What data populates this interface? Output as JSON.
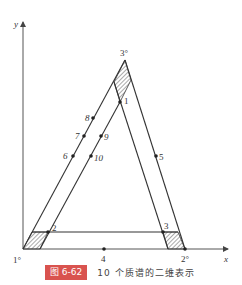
{
  "figure": {
    "badge": "图 6-62",
    "caption": "10 个质谱的二维表示",
    "accent_color": "#d9534f"
  },
  "axes": {
    "x_label": "x",
    "y_label": "y"
  },
  "vertices": {
    "origin": "1°",
    "right": "2°",
    "apex": "3°"
  },
  "points": [
    {
      "id": "1",
      "label": "1"
    },
    {
      "id": "2",
      "label": "2"
    },
    {
      "id": "3",
      "label": "3"
    },
    {
      "id": "4",
      "label": "4"
    },
    {
      "id": "5",
      "label": "5"
    },
    {
      "id": "6",
      "label": "6"
    },
    {
      "id": "7",
      "label": "7"
    },
    {
      "id": "8",
      "label": "8"
    },
    {
      "id": "9",
      "label": "9"
    },
    {
      "id": "10",
      "label": "10"
    }
  ]
}
